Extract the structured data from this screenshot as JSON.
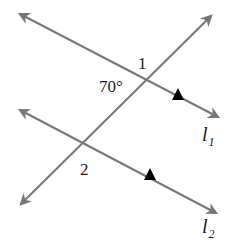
{
  "diagram": {
    "type": "parallel-lines-transversal",
    "colors": {
      "line": "#777777",
      "marker": "#000000",
      "text": "#1a1a1a",
      "background": "#ffffff"
    },
    "lines": [
      {
        "id": "l1",
        "label_main": "l",
        "label_sub": "1",
        "from": [
          18,
          13
        ],
        "to": [
          220,
          118
        ],
        "parallel_marker": true
      },
      {
        "id": "l2",
        "label_main": "l",
        "label_sub": "2",
        "from": [
          18,
          109
        ],
        "to": [
          218,
          214
        ],
        "parallel_marker": true
      },
      {
        "id": "transversal",
        "from": [
          20,
          205
        ],
        "to": [
          212,
          15
        ]
      }
    ],
    "angles": [
      {
        "label": "1",
        "position": "above right-upper intersection"
      },
      {
        "label": "70°",
        "position": "left of upper intersection"
      },
      {
        "label": "2",
        "position": "below lower intersection"
      }
    ],
    "texts": {
      "angle1": "1",
      "angle_given": "70°",
      "angle2": "2",
      "l1_main": "l",
      "l1_sub": "1",
      "l2_main": "l",
      "l2_sub": "2"
    }
  }
}
